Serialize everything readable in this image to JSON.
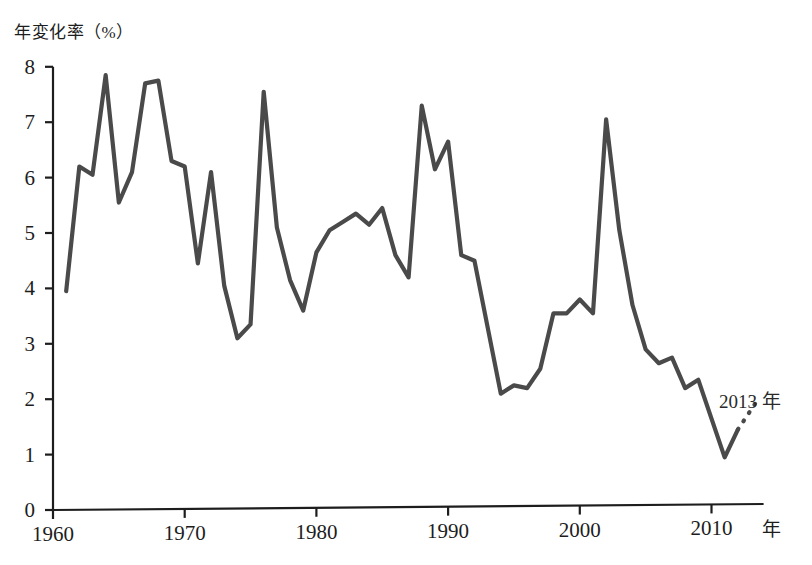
{
  "chart_data": {
    "type": "line",
    "title": "年変化率（%）",
    "xlabel": "年",
    "ylabel": "",
    "ylim": [
      0,
      8
    ],
    "xlim": [
      1960,
      2013.5
    ],
    "ytick_labels": [
      "0",
      "1",
      "2",
      "3",
      "4",
      "5",
      "6",
      "7",
      "8"
    ],
    "ytick_values": [
      0,
      1,
      2,
      3,
      4,
      5,
      6,
      7,
      8
    ],
    "xtick_labels": [
      "1960",
      "1970",
      "1980",
      "1990",
      "2000",
      "2010"
    ],
    "xtick_values": [
      1960,
      1970,
      1980,
      1990,
      2000,
      2010
    ],
    "grid": false,
    "legend": "none",
    "line_color": "#4a4a4a",
    "axis_color": "#1d1d1d",
    "x": [
      1961,
      1962,
      1963,
      1964,
      1965,
      1966,
      1967,
      1968,
      1969,
      1970,
      1971,
      1972,
      1973,
      1974,
      1975,
      1976,
      1977,
      1978,
      1979,
      1980,
      1981,
      1982,
      1983,
      1984,
      1985,
      1986,
      1987,
      1988,
      1989,
      1990,
      1991,
      1992,
      1993,
      1994,
      1995,
      1996,
      1997,
      1998,
      1999,
      2000,
      2001,
      2002,
      2003,
      2004,
      2005,
      2006,
      2007,
      2008,
      2009,
      2010,
      2011,
      2012
    ],
    "values": [
      3.95,
      6.2,
      6.05,
      7.85,
      5.55,
      6.1,
      7.7,
      7.75,
      6.3,
      6.2,
      4.45,
      6.1,
      4.05,
      3.1,
      3.35,
      7.55,
      5.1,
      4.15,
      3.6,
      4.65,
      5.05,
      5.2,
      5.35,
      5.15,
      5.45,
      4.6,
      4.2,
      7.3,
      6.15,
      6.65,
      4.6,
      4.5,
      3.3,
      2.1,
      2.25,
      2.2,
      2.55,
      3.55,
      3.55,
      3.8,
      3.55,
      7.05,
      5.05,
      3.7,
      2.9,
      2.65,
      2.75,
      2.2,
      2.35,
      1.65,
      0.95,
      1.45
    ],
    "dotted_continuation": {
      "from_x": 2012,
      "from_y": 1.45,
      "to_x": 2013.4,
      "to_y": 1.95
    },
    "annotations": [
      {
        "name": "2013-label",
        "text": "2013 年",
        "x": 2013,
        "y": 2.1
      }
    ]
  },
  "axis_unit_label": "年"
}
